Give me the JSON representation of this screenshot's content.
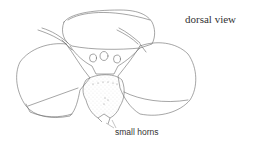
{
  "figure": {
    "view_label": "dorsal view",
    "annotations": [
      {
        "id": "horns",
        "text": "small horns"
      }
    ],
    "colors": {
      "line": "#6a6a6a",
      "stipple": "#8a8a8a",
      "text": "#333333",
      "background": "#ffffff"
    }
  }
}
